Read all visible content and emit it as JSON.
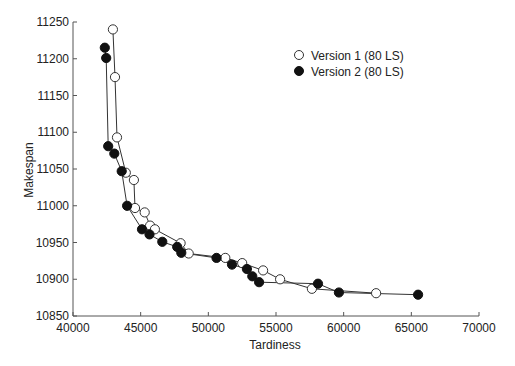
{
  "chart_data": {
    "type": "line",
    "title": "",
    "xlabel": "Tardiness",
    "ylabel": "Makespan",
    "xlim": [
      40000,
      70000
    ],
    "ylim": [
      10850,
      11250
    ],
    "xticks": [
      40000,
      45000,
      50000,
      55000,
      60000,
      65000,
      70000
    ],
    "yticks": [
      10850,
      10900,
      10950,
      11000,
      11050,
      11100,
      11150,
      11200,
      11250
    ],
    "grid": false,
    "legend_position": "upper right (inside)",
    "series": [
      {
        "name": "Version 1 (80 LS)",
        "marker": "open-circle",
        "x": [
          42950,
          43100,
          43250,
          43900,
          44500,
          44580,
          45300,
          45700,
          46050,
          47950,
          48550,
          51250,
          52500,
          54050,
          55300,
          57650,
          62400
        ],
        "y": [
          11240,
          11175,
          11093,
          11045,
          11035,
          10997,
          10991,
          10973,
          10968,
          10949,
          10935,
          10929,
          10922,
          10912,
          10900,
          10887,
          10881
        ]
      },
      {
        "name": "Version 2 (80 LS)",
        "marker": "filled-circle",
        "x": [
          42350,
          42450,
          42600,
          43050,
          43600,
          44000,
          45100,
          45650,
          46600,
          47700,
          48000,
          50600,
          51750,
          52850,
          53250,
          53750,
          58100,
          59650,
          65500
        ],
        "y": [
          11215,
          11201,
          11081,
          11071,
          11047,
          11000,
          10968,
          10961,
          10951,
          10944,
          10936,
          10929,
          10920,
          10914,
          10904,
          10896,
          10894,
          10882,
          10879
        ]
      }
    ]
  },
  "labels": {
    "xlabel": "Tardiness",
    "ylabel": "Makespan",
    "legend": [
      "Version 1 (80 LS)",
      "Version 2 (80 LS)"
    ]
  },
  "colors": {
    "axis": "#555555",
    "line": "#333333",
    "marker_fill_v2": "#111111",
    "marker_fill_v1": "#ffffff"
  }
}
